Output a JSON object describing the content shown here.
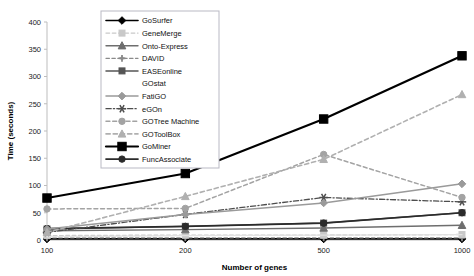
{
  "chart_data": {
    "type": "line",
    "title": "",
    "xlabel": "Number of genes",
    "ylabel": "Time (seconds)",
    "categories": [
      "100",
      "200",
      "500",
      "1000"
    ],
    "x": [
      100,
      200,
      500,
      1000
    ],
    "ylim": [
      0,
      400
    ],
    "yticks": [
      0,
      50,
      100,
      150,
      200,
      250,
      300,
      350,
      400
    ],
    "ytick_labels": [
      "0",
      "50",
      "100",
      "150",
      "200",
      "250",
      "300",
      "350",
      "400"
    ],
    "grid": false,
    "legend_position": "upper-left-inside",
    "series": [
      {
        "name": "GoSurfer",
        "values": [
          2,
          2,
          2,
          2
        ],
        "color": "#000000",
        "marker": "diamond",
        "dash": "solid",
        "width": 1.6
      },
      {
        "name": "GeneMerge",
        "values": [
          8,
          9,
          9,
          10
        ],
        "color": "#c9c9c9",
        "marker": "square",
        "dash": "dashed",
        "width": 1.4
      },
      {
        "name": "Onto-Express",
        "values": [
          17,
          19,
          22,
          27
        ],
        "color": "#6e6e6e",
        "marker": "triangle",
        "dash": "solid",
        "width": 1.4
      },
      {
        "name": "DAVID",
        "values": [
          4,
          4,
          4,
          4
        ],
        "color": "#8a8a8a",
        "marker": "cross",
        "dash": "dashed",
        "width": 1.3
      },
      {
        "name": "EASEonline",
        "values": [
          20,
          25,
          31,
          50
        ],
        "color": "#555555",
        "marker": "square",
        "dash": "solid",
        "width": 1.5
      },
      {
        "name": "GOstat",
        "values": [
          6,
          8,
          9,
          10
        ],
        "color": "#e2e2e2",
        "marker": "none",
        "dash": "solid",
        "width": 1.3
      },
      {
        "name": "FatiGO",
        "values": [
          20,
          47,
          68,
          103
        ],
        "color": "#9a9a9a",
        "marker": "diamond",
        "dash": "solid",
        "width": 1.5
      },
      {
        "name": "eGOn",
        "values": [
          14,
          47,
          78,
          70
        ],
        "color": "#4d4d4d",
        "marker": "asterisk",
        "dash": "dashdot",
        "width": 1.3
      },
      {
        "name": "GOTree Machine",
        "values": [
          57,
          58,
          157,
          78
        ],
        "color": "#a3a3a3",
        "marker": "circle",
        "dash": "dashed",
        "width": 1.5
      },
      {
        "name": "GOToolBox",
        "values": [
          14,
          80,
          148,
          267
        ],
        "color": "#b0b0b0",
        "marker": "triangle",
        "dash": "dashed",
        "width": 1.6
      },
      {
        "name": "GoMiner",
        "values": [
          77,
          122,
          222,
          338
        ],
        "color": "#000000",
        "marker": "bigsquare",
        "dash": "solid",
        "width": 2.2
      },
      {
        "name": "FuncAssociate",
        "values": [
          21,
          25,
          31,
          50
        ],
        "color": "#2b2b2b",
        "marker": "circle",
        "dash": "solid",
        "width": 1.7
      }
    ]
  },
  "legend": {
    "items": [
      {
        "label": "GoSurfer"
      },
      {
        "label": "GeneMerge"
      },
      {
        "label": "Onto-Express"
      },
      {
        "label": "DAVID"
      },
      {
        "label": "EASEonline"
      },
      {
        "label": "GOstat"
      },
      {
        "label": "FatiGO"
      },
      {
        "label": "eGOn"
      },
      {
        "label": "GOTree Machine"
      },
      {
        "label": "GOToolBox"
      },
      {
        "label": "GoMiner"
      },
      {
        "label": "FuncAssociate"
      }
    ]
  },
  "colors": {
    "axis": "#bdbdbd",
    "text": "#1a1a1a",
    "legend_border": "#b9b9c4",
    "background": "#ffffff"
  }
}
